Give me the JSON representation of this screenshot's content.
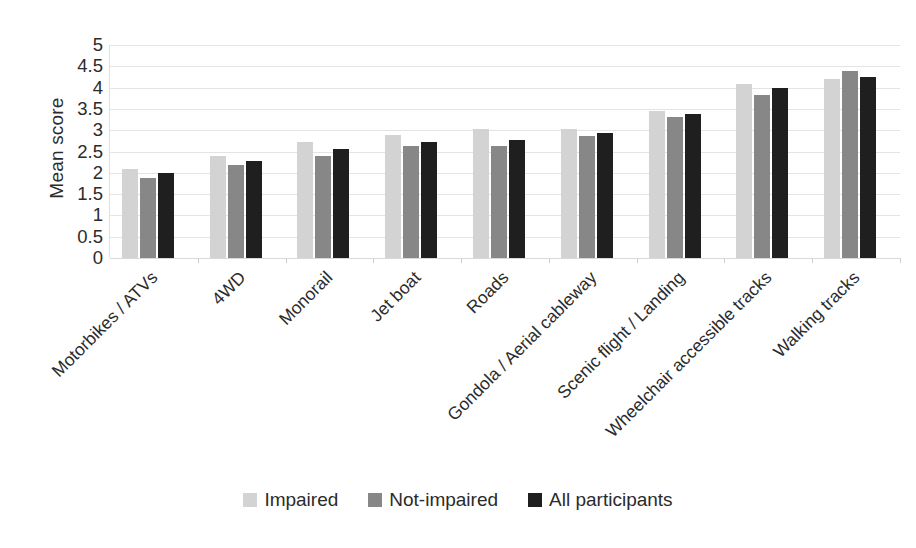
{
  "chart_data": {
    "type": "bar",
    "title": "",
    "subtitle": "",
    "xlabel": "",
    "ylabel": "Mean score",
    "ylim": [
      0,
      5
    ],
    "ytick_step": 0.5,
    "yticks": [
      "5",
      "4.5",
      "4",
      "3.5",
      "3",
      "2.5",
      "2",
      "1.5",
      "1",
      "0.5",
      "0"
    ],
    "grid": true,
    "legend_position": "bottom",
    "orientation": "vertical",
    "categories": [
      "Motorbikes / ATVs",
      "4WD",
      "Monorail",
      "Jet boat",
      "Roads",
      "Gondola / Aerial cableway",
      "Scenic flight / Landing",
      "Wheelchair accessible tracks",
      "Walking tracks"
    ],
    "series": [
      {
        "name": "Impaired",
        "color": "#d3d3d3",
        "values": [
          2.08,
          2.4,
          2.73,
          2.88,
          3.02,
          3.04,
          3.45,
          4.08,
          4.2
        ]
      },
      {
        "name": "Not-impaired",
        "color": "#878787",
        "values": [
          1.87,
          2.18,
          2.4,
          2.64,
          2.62,
          2.87,
          3.3,
          3.82,
          4.4
        ]
      },
      {
        "name": "All participants",
        "color": "#1f1f1f",
        "values": [
          1.99,
          2.28,
          2.57,
          2.73,
          2.76,
          2.94,
          3.38,
          3.98,
          4.25
        ]
      }
    ]
  },
  "legend": {
    "items": [
      {
        "label": "Impaired",
        "color": "#d3d3d3"
      },
      {
        "label": "Not-impaired",
        "color": "#878787"
      },
      {
        "label": "All participants",
        "color": "#1f1f1f"
      }
    ]
  },
  "colors": {
    "background": "#ffffff",
    "gridline": "#e4e4e4",
    "text": "#2b2b2b"
  }
}
